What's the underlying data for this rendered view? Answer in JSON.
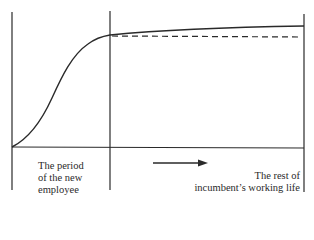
{
  "diagram": {
    "type": "learning-curve",
    "regions": [
      {
        "id": "new-employee",
        "label_lines": [
          "The period",
          "of the new",
          "employee"
        ]
      },
      {
        "id": "incumbent",
        "label_lines": [
          "The rest of",
          "incumbent’s working life"
        ]
      }
    ],
    "series": [
      {
        "name": "new employee productivity curve",
        "style": "solid"
      },
      {
        "name": "plateau reference",
        "style": "dashed"
      }
    ],
    "arrow": {
      "direction": "right"
    },
    "colors": {
      "line": "#2a2a2a",
      "background": "#ffffff"
    }
  }
}
